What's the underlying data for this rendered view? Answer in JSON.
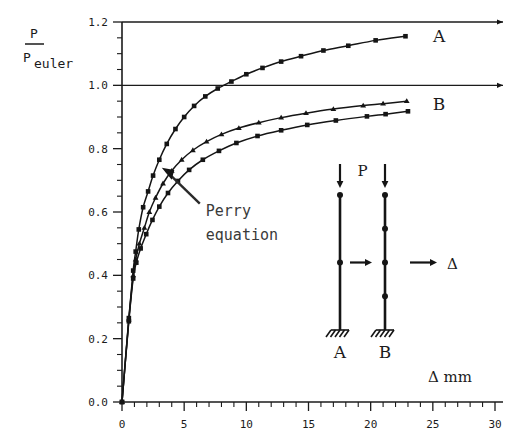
{
  "chart_data": {
    "type": "line",
    "title": "",
    "xlabel": "Δ  mm",
    "ylabel_numerator": "P",
    "ylabel_denominator_base": "P",
    "ylabel_denominator_sub": "euler",
    "xlim": [
      0,
      30
    ],
    "ylim": [
      0.0,
      1.2
    ],
    "xticks": [
      0,
      5,
      10,
      15,
      20,
      25,
      30
    ],
    "xtick_labels": [
      "0",
      "5",
      "10",
      "15",
      "20",
      "25",
      "30"
    ],
    "x_minor_step": 1,
    "yticks": [
      0.0,
      0.2,
      0.4,
      0.6,
      0.8,
      1.0,
      1.2
    ],
    "ytick_labels": [
      "0.0",
      "0.2",
      "0.4",
      "0.6",
      "0.8",
      "1.0",
      "1.2"
    ],
    "y_minor_step": 0.05,
    "grid": false,
    "reference_lines": [
      {
        "name": "top-border-line",
        "y": 1.2
      },
      {
        "name": "euler-unity-line",
        "y": 1.0
      }
    ],
    "legend_position": "inline-right-of-curves",
    "annotations": [
      {
        "name": "perry-equation-note",
        "text_line1": "Perry",
        "text_line2": "equation",
        "points_to_series": "Perry equation",
        "x": 3.2,
        "y": 0.74
      }
    ],
    "series": [
      {
        "name": "A",
        "label": "A",
        "marker": "square",
        "label_x": 25.5,
        "label_y": 1.155,
        "x": [
          0.0,
          0.55,
          0.9,
          1.1,
          1.35,
          1.7,
          2.1,
          2.5,
          3.0,
          3.6,
          4.3,
          5.0,
          5.8,
          6.7,
          7.7,
          8.8,
          10.0,
          11.3,
          12.8,
          14.4,
          16.2,
          18.2,
          20.4,
          22.8
        ],
        "y": [
          0.0,
          0.265,
          0.415,
          0.475,
          0.545,
          0.615,
          0.665,
          0.715,
          0.765,
          0.815,
          0.862,
          0.9,
          0.935,
          0.965,
          0.99,
          1.012,
          1.035,
          1.055,
          1.075,
          1.092,
          1.11,
          1.125,
          1.142,
          1.155
        ]
      },
      {
        "name": "Perry equation",
        "label": "",
        "marker": "triangle",
        "x": [
          0.0,
          0.55,
          0.9,
          1.1,
          1.4,
          1.8,
          2.2,
          2.7,
          3.3,
          4.0,
          4.8,
          5.7,
          6.8,
          8.0,
          9.4,
          11.0,
          12.8,
          14.8,
          17.0,
          19.4,
          21.0,
          22.9
        ],
        "y": [
          0.0,
          0.26,
          0.4,
          0.45,
          0.5,
          0.55,
          0.6,
          0.645,
          0.69,
          0.73,
          0.765,
          0.795,
          0.822,
          0.845,
          0.865,
          0.882,
          0.898,
          0.912,
          0.925,
          0.936,
          0.942,
          0.95
        ]
      },
      {
        "name": "B",
        "label": "B",
        "marker": "square",
        "label_x": 25.5,
        "label_y": 0.94,
        "x": [
          0.0,
          0.55,
          0.9,
          1.15,
          1.5,
          1.95,
          2.45,
          3.0,
          3.7,
          4.5,
          5.4,
          6.5,
          7.8,
          9.2,
          10.9,
          12.8,
          14.9,
          17.2,
          19.7,
          21.2,
          23.0
        ],
        "y": [
          0.0,
          0.255,
          0.39,
          0.44,
          0.485,
          0.53,
          0.575,
          0.617,
          0.66,
          0.698,
          0.733,
          0.765,
          0.793,
          0.818,
          0.84,
          0.858,
          0.875,
          0.889,
          0.902,
          0.909,
          0.918
        ]
      }
    ]
  },
  "inset_diagram": {
    "name": "column-buckling-diagram",
    "load_label": "P",
    "deflection_label": "Δ",
    "column_a_label": "A",
    "column_b_label": "B",
    "column_a_nodes": 1,
    "column_b_nodes": 3,
    "support_type": "fixed-base-hatched"
  }
}
